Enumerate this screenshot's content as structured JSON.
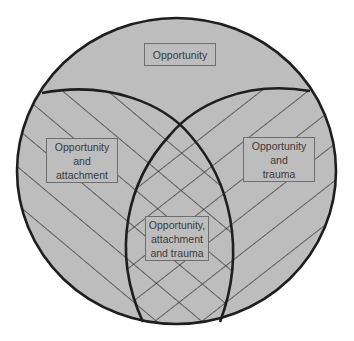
{
  "diagram": {
    "type": "nested-venn",
    "colors": {
      "fill": "#bdbdbd",
      "outline": "#1e1e1e",
      "hatch": "#2a2a2a",
      "box_border": "#6e6e6e",
      "text": "#3a3a3a",
      "background": "#ffffff"
    },
    "regions": {
      "outer": {
        "lines": [
          "Opportunity"
        ]
      },
      "left": {
        "lines": [
          "Opportunity",
          "and",
          "attachment"
        ],
        "pattern": "diagonal-hatch-down"
      },
      "right": {
        "lines": [
          "Opportunity",
          "and",
          "trauma"
        ],
        "pattern": "diagonal-hatch-up"
      },
      "center": {
        "lines": [
          "Opportunity,",
          "attachment",
          "and trauma"
        ],
        "pattern": "cross-hatch"
      }
    }
  }
}
